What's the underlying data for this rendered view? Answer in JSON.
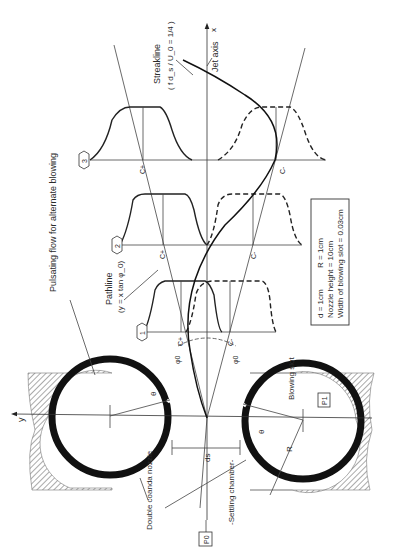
{
  "diagram": {
    "axes": {
      "x_label": "x",
      "y_label": "y",
      "jet_axis_label": "Jet axis"
    },
    "labels": {
      "streakline_title": "Streakline",
      "streakline_eq": "( f d_s / U_0 = 1/4 )",
      "pathline_title": "Pathline",
      "pathline_eq": "(y = x tan φ_0)",
      "pulsating_flow": "Pulsating flow for alternate blowing",
      "double_coanda": "Double coanda nozzle",
      "settling_chamber": "-Settling chamber-",
      "blowing_slot": "Blowing slot",
      "p0": "P0",
      "p1": "P1",
      "ds": "ds",
      "R": "R",
      "theta": "θ",
      "phi0": "φ0",
      "c_plus": "C+",
      "c_minus": "C-"
    },
    "stations": [
      {
        "id": "1",
        "label": "1"
      },
      {
        "id": "2",
        "label": "2"
      },
      {
        "id": "3",
        "label": "3"
      }
    ],
    "parameters_box": {
      "line1_d": "d = 1cm",
      "line1_R": "R = 1cm",
      "line2": "Nozzle height = 10cm",
      "line3": "Width of blowing slot = 0.03cm"
    }
  }
}
